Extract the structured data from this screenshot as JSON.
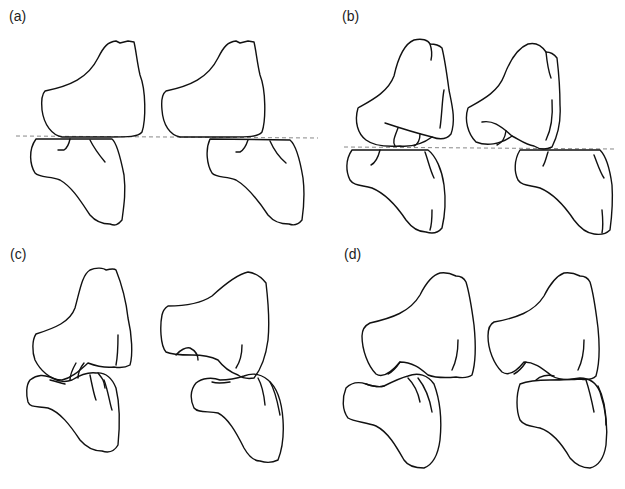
{
  "figure": {
    "panels": [
      {
        "id": "a",
        "label": "(a)",
        "has_reference_line": true
      },
      {
        "id": "b",
        "label": "(b)",
        "has_reference_line": true
      },
      {
        "id": "c",
        "label": "(c)",
        "has_reference_line": false
      },
      {
        "id": "d",
        "label": "(d)",
        "has_reference_line": false
      }
    ],
    "colors": {
      "stroke": "#111111",
      "reference_line": "#888888",
      "background": "#ffffff"
    }
  }
}
